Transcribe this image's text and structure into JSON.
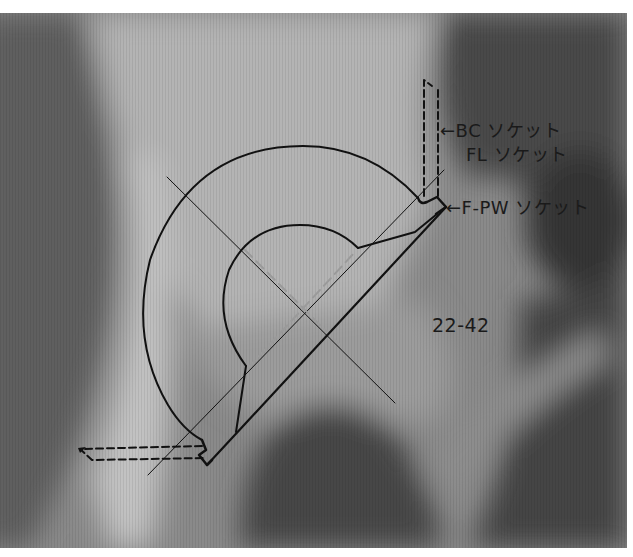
{
  "figure": {
    "template_code": "22-42",
    "labels": [
      {
        "id": "bc",
        "text": "BC ソケット",
        "arrow": "←",
        "x": 440,
        "y": 116
      },
      {
        "id": "fl",
        "text": "FL ソケット",
        "arrow": "",
        "x": 466,
        "y": 140
      },
      {
        "id": "fpw",
        "text": "F-PW ソケット",
        "arrow": "←",
        "x": 446,
        "y": 193
      }
    ],
    "code_label": {
      "text": "22-42",
      "x": 432,
      "y": 314
    },
    "colors": {
      "line": "#111111",
      "xray_dark": "#3a3a3a",
      "xray_mid": "#7c7c7c",
      "xray_light": "#b8b8b8",
      "background": "#ffffff"
    }
  }
}
